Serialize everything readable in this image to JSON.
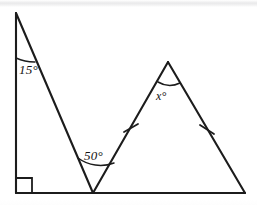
{
  "figure": {
    "kind": "geometry-diagram",
    "background_color": "#ffffff",
    "stroke_color": "#1c1c1c"
  },
  "labels": {
    "left_apex_angle": "15°",
    "middle_vertex_angle": "50°",
    "unknown_apex_angle": "x°"
  },
  "markers": {
    "right_angle": "right-angle-square",
    "congruent_side_ticks": 2
  },
  "geometry": {
    "points": {
      "left_apex": [
        16,
        13
      ],
      "left_base": [
        16,
        193
      ],
      "middle_vertex": [
        93,
        193
      ],
      "right_apex": [
        168,
        62
      ],
      "right_base": [
        245,
        193
      ]
    },
    "segments": [
      {
        "name": "left-vertical-leg",
        "from": "left_apex",
        "to": "left_base"
      },
      {
        "name": "left-hypotenuse",
        "from": "left_apex",
        "to": "middle_vertex"
      },
      {
        "name": "base-line",
        "from": "left_base",
        "to": "right_base"
      },
      {
        "name": "isosceles-left-side",
        "from": "middle_vertex",
        "to": "right_apex"
      },
      {
        "name": "isosceles-right-side",
        "from": "right_apex",
        "to": "right_base"
      }
    ]
  }
}
